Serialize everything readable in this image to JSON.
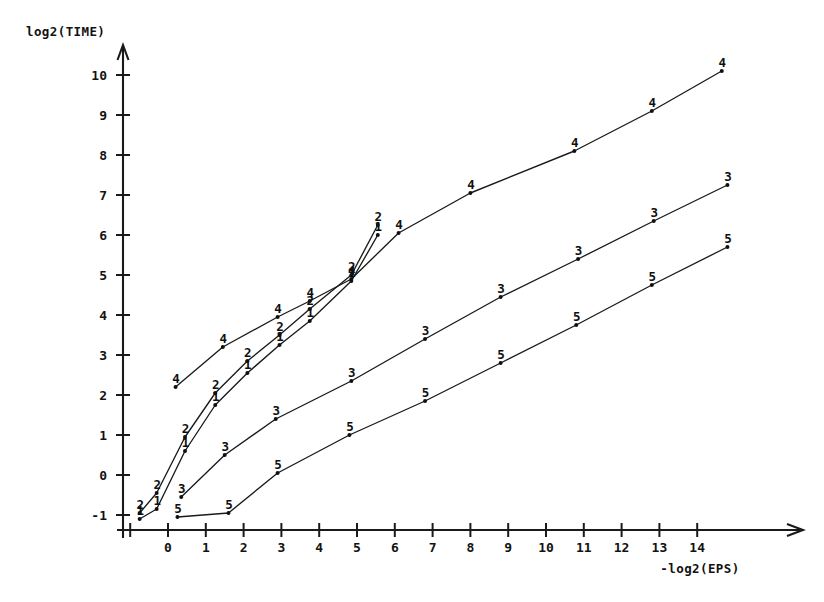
{
  "chart_data": {
    "type": "line",
    "title": "",
    "xlabel": "-log2(EPS)",
    "ylabel": "log2(TIME)",
    "xlim": [
      -1.4,
      15.6
    ],
    "ylim": [
      -1.45,
      10.6
    ],
    "xticks": [
      -1,
      0,
      1,
      2,
      3,
      4,
      5,
      6,
      7,
      8,
      9,
      10,
      11,
      12,
      13,
      14
    ],
    "xticklabels": [
      "",
      "0",
      "1",
      "2",
      "3",
      "4",
      "5",
      "6",
      "7",
      "8",
      "9",
      "10",
      "11",
      "12",
      "13",
      "14"
    ],
    "yticks": [
      -1,
      0,
      1,
      2,
      3,
      4,
      5,
      6,
      7,
      8,
      9,
      10
    ],
    "yticklabels": [
      "-1",
      "0",
      "1",
      "2",
      "3",
      "4",
      "5",
      "6",
      "7",
      "8",
      "9",
      "10"
    ],
    "grid": false,
    "legend": "none",
    "marker_style": "series-number",
    "axis_color": "#1a1a1a",
    "line_color": "#1a1a1a",
    "series": [
      {
        "name": "1",
        "marker": "1",
        "x": [
          -0.75,
          -0.3,
          0.45,
          1.25,
          2.1,
          2.95,
          3.75,
          4.85,
          5.55
        ],
        "y": [
          -1.1,
          -0.85,
          0.6,
          1.75,
          2.55,
          3.25,
          3.85,
          4.85,
          6.0
        ]
      },
      {
        "name": "2",
        "marker": "2",
        "x": [
          -0.75,
          -0.3,
          0.45,
          1.25,
          2.1,
          2.95,
          3.75,
          4.85,
          5.55
        ],
        "y": [
          -0.95,
          -0.45,
          0.95,
          2.05,
          2.85,
          3.5,
          4.15,
          5.0,
          6.25
        ]
      },
      {
        "name": "3",
        "marker": "3",
        "x": [
          0.35,
          1.5,
          2.85,
          4.85,
          6.8,
          8.8,
          10.85,
          12.85,
          14.8
        ],
        "y": [
          -0.55,
          0.5,
          1.4,
          2.35,
          3.4,
          4.45,
          5.4,
          6.35,
          7.25
        ]
      },
      {
        "name": "4",
        "marker": "4",
        "x": [
          0.2,
          1.45,
          2.9,
          3.75,
          4.85,
          6.1,
          8.0,
          10.75,
          12.8,
          14.65
        ],
        "y": [
          2.2,
          3.2,
          3.95,
          4.35,
          4.9,
          6.05,
          7.05,
          8.1,
          9.1,
          10.1
        ]
      },
      {
        "name": "5",
        "marker": "5",
        "x": [
          0.25,
          1.6,
          2.9,
          4.8,
          6.8,
          8.8,
          10.8,
          12.8,
          14.8
        ],
        "y": [
          -1.05,
          -0.95,
          0.05,
          1.0,
          1.85,
          2.8,
          3.75,
          4.75,
          5.7
        ]
      }
    ]
  }
}
